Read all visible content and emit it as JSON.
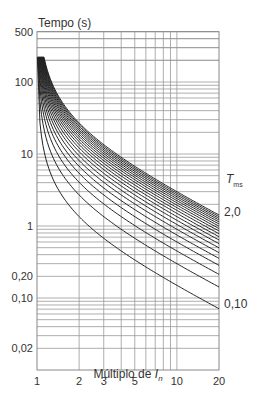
{
  "chart_data": {
    "type": "line",
    "title": "",
    "ylabel": "Tempo (s)",
    "xlabel_prefix": "Múltiplo de ",
    "xlabel_var": "I",
    "xlabel_sub": "n",
    "xscale": "log",
    "yscale": "log",
    "xlim": [
      1,
      20
    ],
    "ylim": [
      0.01,
      500
    ],
    "x_ticks": [
      1,
      2,
      3,
      5,
      10,
      20
    ],
    "x_tick_labels": [
      "1",
      "2",
      "3",
      "5",
      "10",
      "20"
    ],
    "y_ticks": [
      500,
      100,
      10,
      1,
      0.2,
      0.1,
      0.02
    ],
    "y_tick_labels": [
      "500",
      "100",
      "10",
      "1",
      "0,20",
      "0,10",
      "0,02"
    ],
    "grid": true,
    "curve_family_label": "T",
    "curve_family_sub": "ms",
    "curve_label_top": "2,0",
    "curve_label_bottom": "0,10",
    "curve_formula": "t = 13.5 * Tms / (M - 1)",
    "t_max_clip": 220,
    "series": [
      {
        "name": "Tms 0.1",
        "tms": 0.1
      },
      {
        "name": "Tms 0.2",
        "tms": 0.2
      },
      {
        "name": "Tms 0.3",
        "tms": 0.3
      },
      {
        "name": "Tms 0.4",
        "tms": 0.4
      },
      {
        "name": "Tms 0.5",
        "tms": 0.5
      },
      {
        "name": "Tms 0.6",
        "tms": 0.6
      },
      {
        "name": "Tms 0.7",
        "tms": 0.7
      },
      {
        "name": "Tms 0.8",
        "tms": 0.8
      },
      {
        "name": "Tms 0.9",
        "tms": 0.9
      },
      {
        "name": "Tms 1.0",
        "tms": 1.0
      },
      {
        "name": "Tms 1.1",
        "tms": 1.1
      },
      {
        "name": "Tms 1.2",
        "tms": 1.2
      },
      {
        "name": "Tms 1.3",
        "tms": 1.3
      },
      {
        "name": "Tms 1.4",
        "tms": 1.4
      },
      {
        "name": "Tms 1.5",
        "tms": 1.5
      },
      {
        "name": "Tms 1.6",
        "tms": 1.6
      },
      {
        "name": "Tms 1.7",
        "tms": 1.7
      },
      {
        "name": "Tms 1.8",
        "tms": 1.8
      },
      {
        "name": "Tms 1.9",
        "tms": 1.9
      },
      {
        "name": "Tms 2.0",
        "tms": 2.0
      }
    ],
    "sample_points": {
      "Tms 0.1": [
        [
          2,
          1.35
        ],
        [
          10,
          0.15
        ],
        [
          20,
          0.071
        ]
      ],
      "Tms 2.0": [
        [
          2,
          27
        ],
        [
          10,
          3.0
        ],
        [
          20,
          1.42
        ]
      ]
    }
  }
}
